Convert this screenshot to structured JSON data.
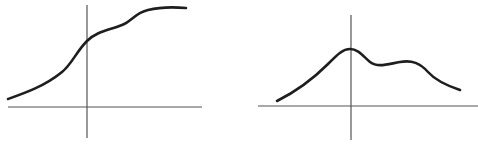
{
  "figure": {
    "colors": {
      "background": "#ffffff",
      "axis": "#555555",
      "curve": "#1e1e1e"
    }
  },
  "chart_data": [
    {
      "type": "line",
      "title": "",
      "xlabel": "",
      "ylabel": "",
      "grid": false,
      "description": "Monotonically increasing S-shaped curve with a slight shoulder, leveling off to a plateau on the right",
      "axes": {
        "x_axis": {
          "x1": 8,
          "x2": 202,
          "y": 107
        },
        "y_axis": {
          "x": 87,
          "y1": 5,
          "y2": 138
        }
      },
      "x": [
        -79,
        -47,
        -22,
        -7,
        0,
        13,
        33,
        48,
        63,
        99
      ],
      "y": [
        8,
        22,
        40,
        59,
        67,
        74,
        81,
        93,
        98,
        99
      ],
      "path": "M8,99 C25,93 45,86 62,72 C72,64 76,52 87,41 C97,31 110,30 122,25 C132,21 135,13 148,10 C160,7 175,7 186,8"
    },
    {
      "type": "line",
      "title": "",
      "xlabel": "",
      "ylabel": "",
      "grid": false,
      "description": "Bimodal bump curve: rises to a maximum at the origin, dips, forms a smaller second hump to the right, then decays",
      "axes": {
        "x_axis": {
          "x1": 258,
          "x2": 478,
          "y": 106
        },
        "y_axis": {
          "x": 351,
          "y1": 15,
          "y2": 140
        }
      },
      "x": [
        -74,
        -41,
        -11,
        -1,
        7,
        24,
        44,
        59,
        77,
        89,
        109
      ],
      "y": [
        5,
        31,
        54,
        57,
        55,
        42,
        43,
        44,
        34,
        22,
        16
      ],
      "path": "M277,101 C295,92 312,80 328,64 C338,54 343,49 350,49 C358,49 363,56 370,62 C378,68 388,64 400,62 C412,60 420,63 428,72 C436,81 448,86 460,90"
    }
  ]
}
